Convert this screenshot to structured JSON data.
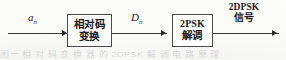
{
  "diagram": {
    "ink_color": "#1b1b1b",
    "line_color": "#3a3a3a",
    "background": "#fdfdfc",
    "blocks": [
      {
        "id": "relative-code-converter",
        "line1": "相对码",
        "line2": "变换"
      },
      {
        "id": "psk-demodulator",
        "line1": "2PSK",
        "line2": "解调"
      }
    ],
    "labels": {
      "output_symbol": "a",
      "output_subscript": "n",
      "mid_symbol": "D",
      "mid_subscript": "n",
      "input_line1": "2DPSK",
      "input_line2": "信号"
    },
    "bleed_through": "图一 相 对 码 变 换 器 的 2DPSK 解 调 电 路 原 理"
  }
}
